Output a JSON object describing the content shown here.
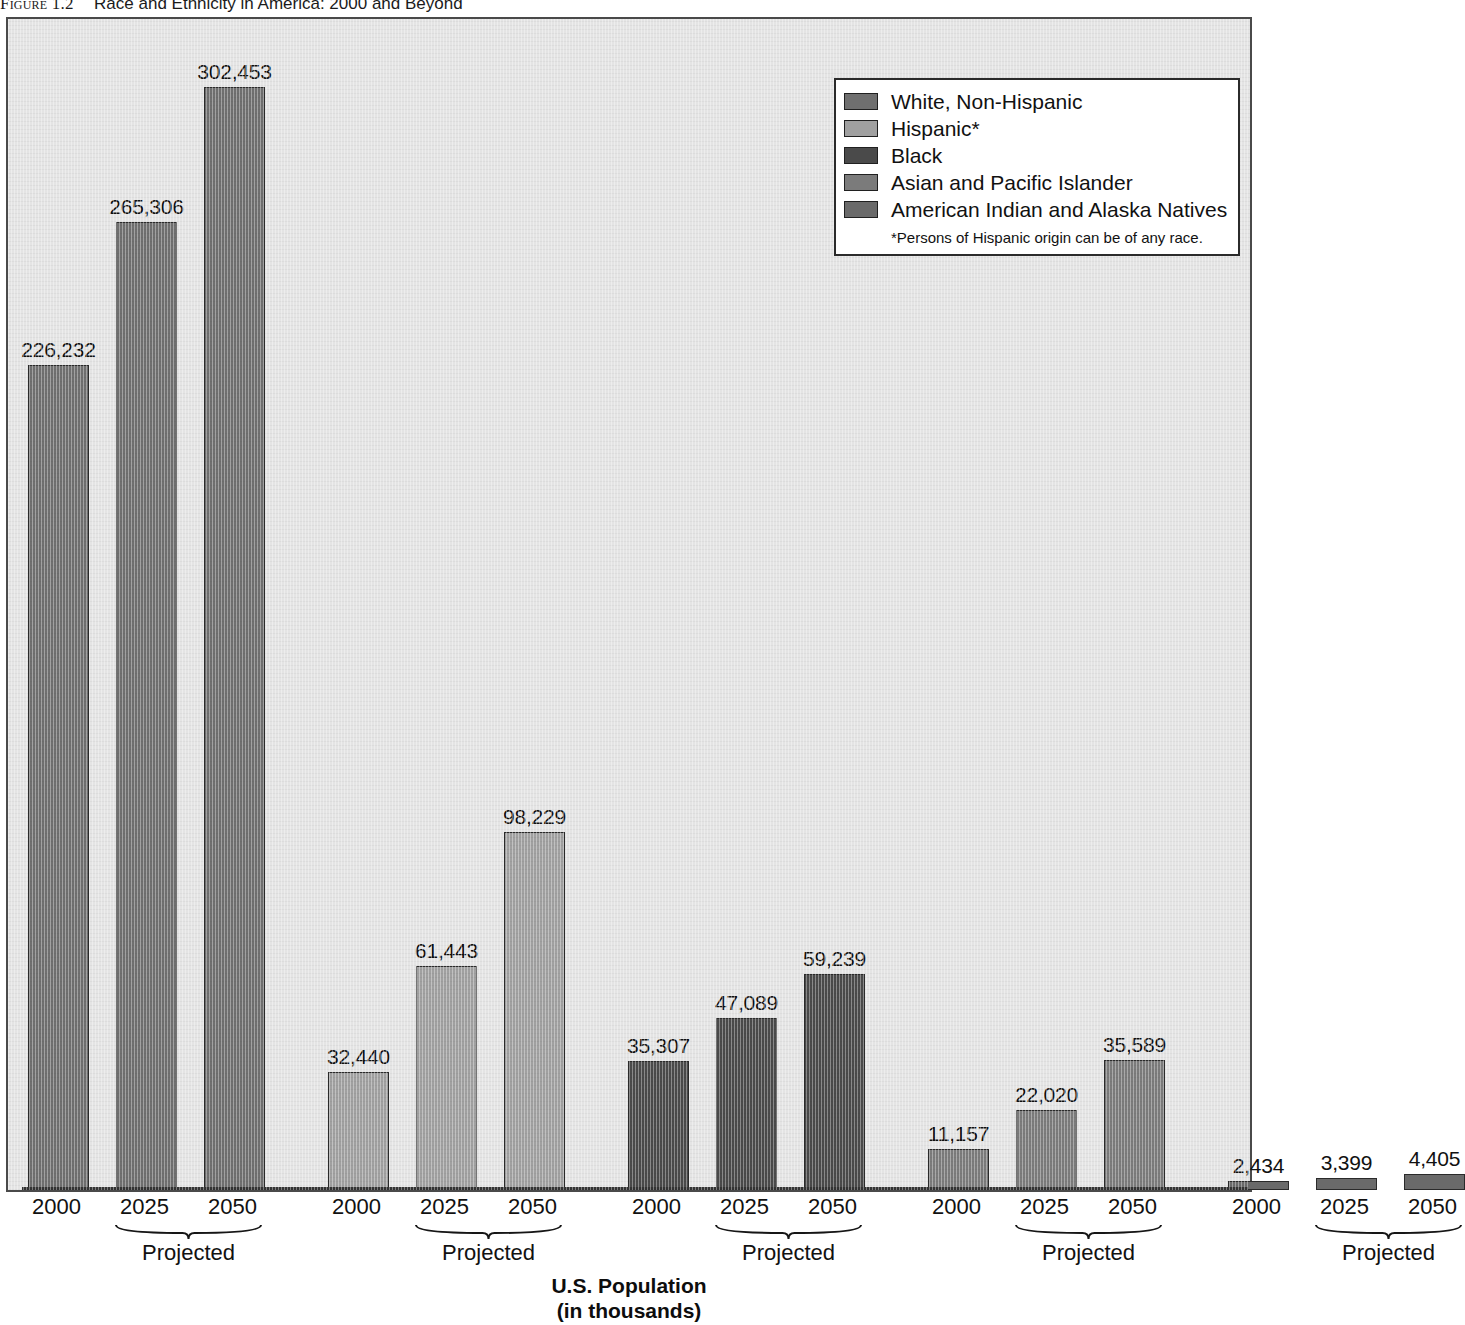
{
  "figure": {
    "number": "Figure 1.2",
    "title": "Race and Ethnicity in America: 2000 and Beyond"
  },
  "legend": {
    "items": [
      {
        "label": "White, Non-Hispanic",
        "color": "#6f6f6f"
      },
      {
        "label": "Hispanic*",
        "color": "#a0a0a0"
      },
      {
        "label": "Black",
        "color": "#4a4a4a"
      },
      {
        "label": "Asian and Pacific Islander",
        "color": "#7b7b7b"
      },
      {
        "label": "American Indian and Alaska Natives",
        "color": "#6a6a6a"
      }
    ],
    "footnote": "*Persons of Hispanic origin can be of any race."
  },
  "axis": {
    "title_line1": "U.S. Population",
    "title_line2": "(in thousands)",
    "projected_label": "Projected",
    "years": [
      "2000",
      "2025",
      "2050"
    ]
  },
  "chart_data": {
    "type": "bar",
    "title": "Race and Ethnicity in America: 2000 and Beyond",
    "xlabel": "U.S. Population (in thousands)",
    "ylabel": "",
    "ylim": [
      0,
      302453
    ],
    "grid": false,
    "legend_position": "top-right",
    "categories": [
      "2000",
      "2025",
      "2050"
    ],
    "category_notes": [
      "",
      "Projected",
      "Projected"
    ],
    "units": "thousands",
    "series": [
      {
        "name": "White, Non-Hispanic",
        "color": "#6f6f6f",
        "values": [
          226232,
          265306,
          302453
        ],
        "labels": [
          "226,232",
          "265,306",
          "302,453"
        ]
      },
      {
        "name": "Hispanic*",
        "color": "#a0a0a0",
        "values": [
          32440,
          61443,
          98229
        ],
        "labels": [
          "32,440",
          "61,443",
          "98,229"
        ]
      },
      {
        "name": "Black",
        "color": "#4a4a4a",
        "values": [
          35307,
          47089,
          59239
        ],
        "labels": [
          "35,307",
          "47,089",
          "59,239"
        ]
      },
      {
        "name": "Asian and Pacific Islander",
        "color": "#7b7b7b",
        "values": [
          11157,
          22020,
          35589
        ],
        "labels": [
          "11,157",
          "22,020",
          "35,589"
        ]
      },
      {
        "name": "American Indian and Alaska Natives",
        "color": "#6a6a6a",
        "values": [
          2434,
          3399,
          4405
        ],
        "labels": [
          "2,434",
          "3,399",
          "4,405"
        ]
      }
    ],
    "footnote": "*Persons of Hispanic origin can be of any race."
  }
}
